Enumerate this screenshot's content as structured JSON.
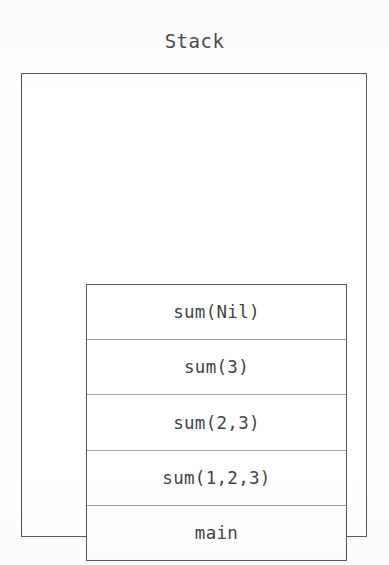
{
  "diagram": {
    "type": "stack-diagram",
    "title": "Stack",
    "background_color": "#ffffff",
    "outline_color": "#5a5a5a",
    "divider_color": "#a0a0a0",
    "text_color": "#434343",
    "outer_box": {
      "name": "stack-container"
    },
    "frames_box": {
      "name": "stack-frames"
    },
    "frames": [
      {
        "label": "sum(Nil)",
        "position": "top"
      },
      {
        "label": "sum(3)",
        "position": "2"
      },
      {
        "label": "sum(2,3)",
        "position": "3"
      },
      {
        "label": "sum(1,2,3)",
        "position": "4"
      },
      {
        "label": "main",
        "position": "bottom"
      }
    ]
  }
}
